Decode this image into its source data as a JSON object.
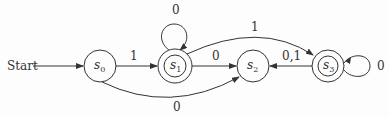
{
  "diagram": {
    "type": "finite-state-machine",
    "start_label": "Start",
    "states": [
      {
        "id": "s0",
        "name": "s",
        "sub": "0",
        "accepting": false
      },
      {
        "id": "s1",
        "name": "s",
        "sub": "1",
        "accepting": true
      },
      {
        "id": "s2",
        "name": "s",
        "sub": "2",
        "accepting": false
      },
      {
        "id": "s3",
        "name": "s",
        "sub": "3",
        "accepting": true
      }
    ],
    "transitions": [
      {
        "from": "s0",
        "to": "s1",
        "label": "1"
      },
      {
        "from": "s0",
        "to": "s2",
        "label": "0"
      },
      {
        "from": "s1",
        "to": "s1",
        "label": "0"
      },
      {
        "from": "s1",
        "to": "s2",
        "label": "0"
      },
      {
        "from": "s1",
        "to": "s3",
        "label": "1"
      },
      {
        "from": "s3",
        "to": "s2",
        "label": "0,1"
      },
      {
        "from": "s3",
        "to": "s3",
        "label": "0"
      }
    ]
  }
}
